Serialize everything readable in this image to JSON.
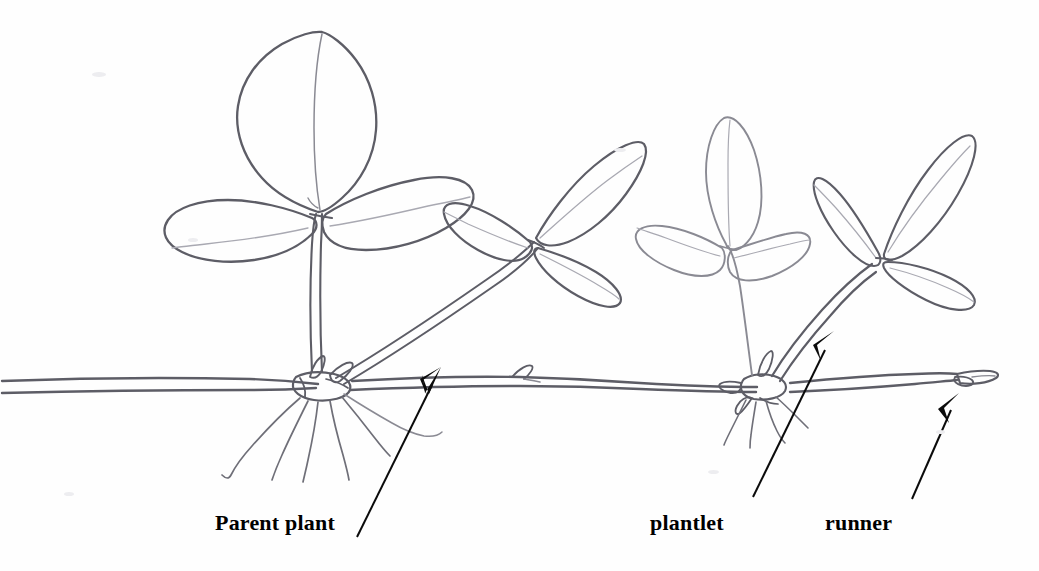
{
  "figure": {
    "medium": "pencil sketch",
    "background_color": "#fefefe",
    "pencil_color": "#6f6f78",
    "arrow_color": "#0b0b0b"
  },
  "labels": {
    "parent_plant": "Parent plant",
    "plantlet": "plantlet",
    "runner": "runner"
  },
  "annotations": [
    {
      "name": "parent-plant-arrow",
      "label": "Parent plant",
      "tail_x": 357,
      "tail_y": 537,
      "tip_x": 441,
      "tip_y": 367,
      "points_to": "parent plant node on the runner"
    },
    {
      "name": "plantlet-arrow",
      "label": "plantlet",
      "tail_x": 753,
      "tail_y": 497,
      "tip_x": 834,
      "tip_y": 331,
      "points_to": "new plantlet shoot rising from the runner"
    },
    {
      "name": "runner-arrow",
      "label": "runner",
      "tail_x": 912,
      "tail_y": 499,
      "tip_x": 959,
      "tip_y": 393,
      "points_to": "horizontal runner stem tip"
    }
  ],
  "structures": {
    "runner_stem": "horizontal double-line stolon spanning the full width at about y = 380",
    "parent_node_x": 318,
    "plantlet_node_x": 758,
    "parent_roots_count": 5,
    "plantlet_roots_count": 4,
    "leaf_clusters": [
      {
        "name": "parent-upper-leaf-cluster",
        "leaflets": 3,
        "center_x": 316,
        "center_y": 215
      },
      {
        "name": "parent-side-leaf-cluster",
        "leaflets": 3,
        "center_x": 533,
        "center_y": 235
      },
      {
        "name": "plantlet-left-leaf-cluster",
        "leaflets": 3,
        "center_x": 726,
        "center_y": 245
      },
      {
        "name": "plantlet-right-leaf-cluster",
        "leaflets": 3,
        "center_x": 888,
        "center_y": 250
      }
    ]
  }
}
